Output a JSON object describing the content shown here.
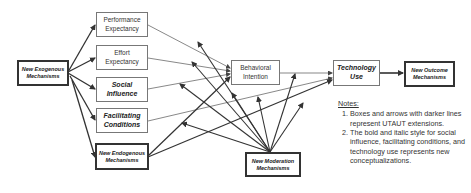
{
  "diagram": {
    "nodes": {
      "exogenous": "New Exogenous Mechanisms",
      "performance": "Performance Expectancy",
      "effort": "Effort Expectancy",
      "social": "Social Influence",
      "facilitating": "Facilitating Conditions",
      "endogenous": "New Endogenous Mechanisms",
      "intention": "Behavioral Intention",
      "use": "Technology Use",
      "outcome": "New Outcome Mechanisms",
      "moderation": "New Moderation Mechanisms"
    },
    "edges": [
      {
        "from": "exogenous",
        "to": "performance",
        "style": "thick"
      },
      {
        "from": "exogenous",
        "to": "effort",
        "style": "thick"
      },
      {
        "from": "exogenous",
        "to": "social",
        "style": "thick"
      },
      {
        "from": "exogenous",
        "to": "facilitating",
        "style": "thick"
      },
      {
        "from": "exogenous",
        "to": "endogenous",
        "style": "thick"
      },
      {
        "from": "performance",
        "to": "intention",
        "style": "thin"
      },
      {
        "from": "effort",
        "to": "intention",
        "style": "thin"
      },
      {
        "from": "social",
        "to": "intention",
        "style": "thin"
      },
      {
        "from": "facilitating",
        "to": "use",
        "style": "thin"
      },
      {
        "from": "intention",
        "to": "use",
        "style": "thin"
      },
      {
        "from": "endogenous",
        "to": "intention",
        "style": "thick"
      },
      {
        "from": "endogenous",
        "to": "use",
        "style": "thick"
      },
      {
        "from": "use",
        "to": "outcome",
        "style": "thick"
      },
      {
        "from": "moderation",
        "to": "edges",
        "style": "thick"
      }
    ]
  },
  "notes": {
    "title": "Notes:",
    "items": [
      "Boxes and arrows with darker lines represent UTAUT extensions.",
      "The bold and italic style for social influence, facilitating conditions, and technology use represents new conceptualizations."
    ]
  }
}
